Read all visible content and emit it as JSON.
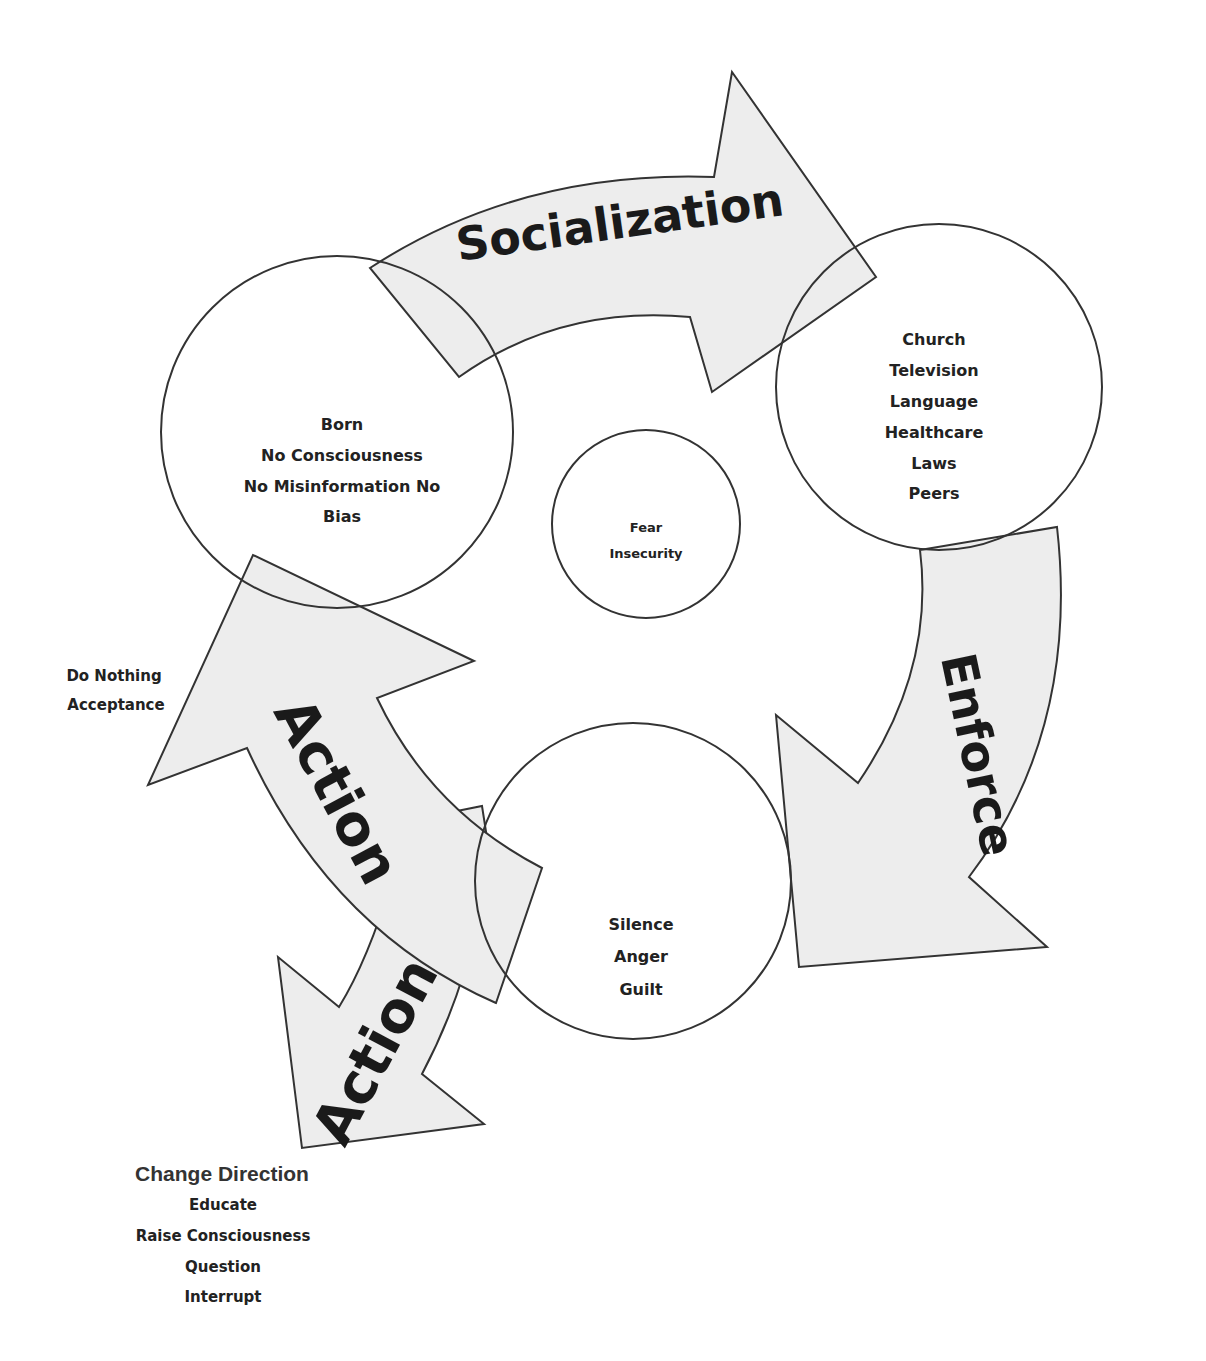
{
  "diagram": {
    "colors": {
      "arrow_fill": "#ededed",
      "stroke": "#333333",
      "text": "#222222",
      "background": "#ffffff"
    },
    "arrows": {
      "socialization": {
        "label": "Socialization"
      },
      "enforce": {
        "label": "Enforce"
      },
      "action_upper": {
        "label": "Action"
      },
      "action_lower": {
        "label": "Action"
      }
    },
    "circles": {
      "start": {
        "lines": [
          "Born",
          "No Consciousness",
          "No Misinformation No",
          "Bias"
        ]
      },
      "institutions": {
        "lines": [
          "Church",
          "Television",
          "Language",
          "Healthcare",
          "Laws",
          "Peers"
        ]
      },
      "center": {
        "lines": [
          "Fear",
          "Insecurity"
        ]
      },
      "results": {
        "lines": [
          "Silence",
          "Anger",
          "Guilt"
        ]
      }
    },
    "side_notes": {
      "do_nothing": {
        "lines": [
          "Do Nothing",
          "Acceptance"
        ]
      },
      "change_direction": {
        "title": "Change Direction",
        "lines": [
          "Educate",
          "Raise Consciousness",
          "Question",
          "Interrupt"
        ]
      }
    }
  }
}
